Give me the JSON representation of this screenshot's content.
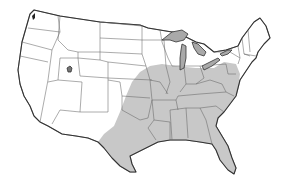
{
  "map": {
    "subject": "Continental United States outline map with state borders",
    "colors": {
      "background": "#ffffff",
      "land": "#ffffff",
      "shaded_region": "#c8c8c8",
      "lakes": "#a9a9a9",
      "border": "#555555",
      "coastline": "#333333"
    },
    "shaded_region": {
      "description": "Gray shaded range covering the eastern and southeastern United States",
      "states_covered": [
        "Texas (east)",
        "Oklahoma",
        "Kansas (east)",
        "Nebraska (southeast)",
        "Iowa",
        "Missouri",
        "Arkansas",
        "Louisiana",
        "Mississippi",
        "Alabama",
        "Georgia",
        "Florida",
        "South Carolina",
        "North Carolina",
        "Tennessee",
        "Kentucky",
        "Illinois",
        "Indiana",
        "Ohio",
        "West Virginia",
        "Virginia",
        "Maryland",
        "Delaware",
        "Pennsylvania",
        "New Jersey"
      ]
    },
    "water_features": [
      "Great Lakes",
      "Great Salt Lake",
      "Puget Sound"
    ]
  }
}
